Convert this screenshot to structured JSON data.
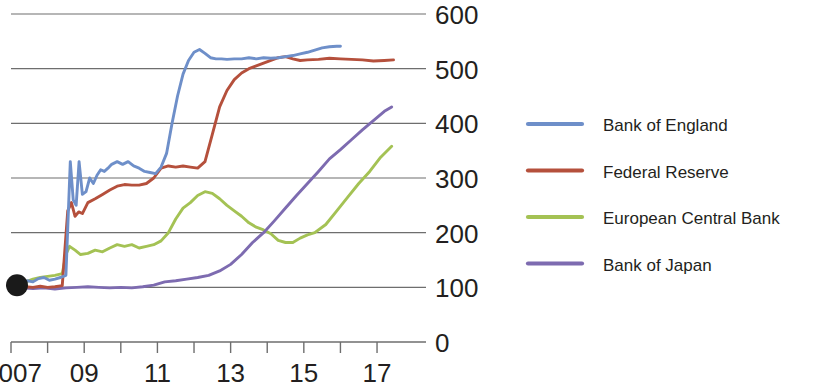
{
  "chart_data": {
    "type": "line",
    "title": "",
    "subtitle": "",
    "xlabel": "",
    "ylabel": "",
    "xlim": [
      2007,
      2017.6
    ],
    "ylim": [
      0,
      600
    ],
    "yticks": [
      0,
      100,
      200,
      300,
      400,
      500,
      600
    ],
    "ytick_labels": [
      "0",
      "100",
      "200",
      "300",
      "400",
      "500",
      "600"
    ],
    "xticks": [
      2007,
      2008,
      2009,
      2010,
      2011,
      2012,
      2013,
      2014,
      2015,
      2016,
      2017
    ],
    "xtick_labels": [
      "2007",
      "",
      "09",
      "",
      "11",
      "",
      "13",
      "",
      "15",
      "",
      "17"
    ],
    "grid": "horizontal",
    "legend_position": "right",
    "index_base": 100,
    "marker": {
      "label": "index-start-dot",
      "x": 2007.0,
      "y": 100,
      "color": "#1a1a1a"
    },
    "series": [
      {
        "name": "Bank of England",
        "color": "#6e8fc9",
        "x": [
          2007.0,
          2007.15,
          2007.3,
          2007.45,
          2007.6,
          2007.75,
          2007.9,
          2008.05,
          2008.2,
          2008.35,
          2008.5,
          2008.62,
          2008.7,
          2008.78,
          2008.86,
          2008.95,
          2009.05,
          2009.15,
          2009.25,
          2009.35,
          2009.45,
          2009.55,
          2009.65,
          2009.75,
          2009.9,
          2010.05,
          2010.2,
          2010.35,
          2010.5,
          2010.65,
          2010.8,
          2010.95,
          2011.1,
          2011.25,
          2011.4,
          2011.55,
          2011.7,
          2011.85,
          2012.0,
          2012.15,
          2012.3,
          2012.45,
          2012.6,
          2012.75,
          2012.9,
          2013.1,
          2013.3,
          2013.5,
          2013.7,
          2013.9,
          2014.1,
          2014.3,
          2014.5,
          2014.7,
          2014.9,
          2015.1,
          2015.3,
          2015.5,
          2015.7,
          2015.9,
          2016.0
        ],
        "y": [
          100,
          104,
          108,
          112,
          110,
          116,
          118,
          113,
          115,
          118,
          122,
          330,
          260,
          250,
          330,
          270,
          275,
          300,
          290,
          305,
          315,
          312,
          318,
          325,
          330,
          325,
          330,
          322,
          318,
          312,
          310,
          308,
          320,
          345,
          400,
          450,
          490,
          515,
          530,
          535,
          528,
          520,
          518,
          518,
          517,
          518,
          518,
          520,
          518,
          520,
          519,
          520,
          522,
          524,
          527,
          530,
          534,
          538,
          540,
          541,
          541
        ]
      },
      {
        "name": "Federal Reserve",
        "color": "#b5503c",
        "x": [
          2007.0,
          2007.2,
          2007.4,
          2007.6,
          2007.8,
          2008.0,
          2008.2,
          2008.4,
          2008.55,
          2008.65,
          2008.75,
          2008.85,
          2008.95,
          2009.1,
          2009.3,
          2009.5,
          2009.7,
          2009.9,
          2010.1,
          2010.3,
          2010.5,
          2010.7,
          2010.9,
          2011.1,
          2011.3,
          2011.5,
          2011.7,
          2011.9,
          2012.1,
          2012.3,
          2012.5,
          2012.7,
          2012.9,
          2013.1,
          2013.3,
          2013.5,
          2013.7,
          2013.9,
          2014.1,
          2014.3,
          2014.5,
          2014.7,
          2014.9,
          2015.1,
          2015.4,
          2015.7,
          2016.0,
          2016.3,
          2016.6,
          2016.9,
          2017.2,
          2017.45
        ],
        "y": [
          100,
          99,
          101,
          100,
          102,
          100,
          101,
          103,
          240,
          255,
          230,
          238,
          235,
          255,
          262,
          270,
          278,
          285,
          288,
          287,
          287,
          290,
          300,
          318,
          322,
          320,
          322,
          320,
          318,
          330,
          380,
          430,
          460,
          480,
          492,
          500,
          505,
          510,
          515,
          520,
          522,
          518,
          515,
          516,
          517,
          519,
          518,
          517,
          516,
          514,
          515,
          516
        ]
      },
      {
        "name": "European Central Bank",
        "color": "#a4c254",
        "x": [
          2007.0,
          2007.2,
          2007.4,
          2007.6,
          2007.8,
          2008.0,
          2008.2,
          2008.4,
          2008.5,
          2008.6,
          2008.75,
          2008.9,
          2009.1,
          2009.3,
          2009.5,
          2009.7,
          2009.9,
          2010.1,
          2010.3,
          2010.5,
          2010.7,
          2010.9,
          2011.1,
          2011.3,
          2011.5,
          2011.7,
          2011.9,
          2012.1,
          2012.3,
          2012.5,
          2012.7,
          2012.9,
          2013.1,
          2013.3,
          2013.5,
          2013.7,
          2013.9,
          2014.1,
          2014.3,
          2014.5,
          2014.7,
          2014.9,
          2015.1,
          2015.3,
          2015.6,
          2015.9,
          2016.2,
          2016.5,
          2016.8,
          2017.1,
          2017.4
        ],
        "y": [
          100,
          105,
          110,
          115,
          118,
          120,
          122,
          125,
          160,
          175,
          168,
          160,
          162,
          168,
          165,
          172,
          178,
          175,
          178,
          172,
          175,
          178,
          185,
          200,
          225,
          245,
          255,
          268,
          275,
          272,
          262,
          250,
          240,
          230,
          218,
          210,
          205,
          198,
          186,
          182,
          182,
          190,
          196,
          200,
          215,
          240,
          265,
          290,
          312,
          338,
          358
        ]
      },
      {
        "name": "Bank of Japan",
        "color": "#7d6bb0",
        "x": [
          2007.0,
          2007.3,
          2007.6,
          2007.9,
          2008.2,
          2008.5,
          2008.8,
          2009.1,
          2009.4,
          2009.7,
          2010.0,
          2010.3,
          2010.6,
          2010.9,
          2011.2,
          2011.5,
          2011.8,
          2012.1,
          2012.4,
          2012.7,
          2013.0,
          2013.3,
          2013.6,
          2013.9,
          2014.2,
          2014.5,
          2014.8,
          2015.1,
          2015.4,
          2015.7,
          2016.0,
          2016.3,
          2016.6,
          2016.9,
          2017.2,
          2017.4
        ],
        "y": [
          100,
          99,
          98,
          99,
          97,
          99,
          100,
          101,
          100,
          99,
          100,
          99,
          101,
          104,
          110,
          112,
          115,
          118,
          122,
          130,
          142,
          160,
          182,
          200,
          222,
          245,
          268,
          290,
          312,
          335,
          352,
          370,
          388,
          405,
          422,
          430
        ]
      }
    ]
  },
  "legend": {
    "items": [
      {
        "label": "Bank of England",
        "color": "#6e8fc9"
      },
      {
        "label": "Federal Reserve",
        "color": "#b5503c"
      },
      {
        "label": "European Central Bank",
        "color": "#a4c254"
      },
      {
        "label": "Bank of Japan",
        "color": "#7d6bb0"
      }
    ]
  },
  "colors": {
    "grid": "#6e6e6e",
    "axis": "#6e6e6e",
    "text": "#231f20",
    "background": "#ffffff"
  }
}
